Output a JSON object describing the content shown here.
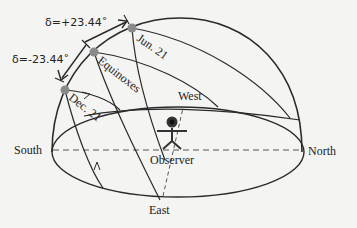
{
  "diagram": {
    "labels": {
      "delta_plus": "δ=+23.44˚",
      "delta_minus": "δ=-23.44˚",
      "jun": "Jun. 21",
      "equinoxes": "Equinoxes",
      "dec": "Dec. 21",
      "west": "West",
      "south": "South",
      "north": "North",
      "east": "East",
      "observer": "Observer"
    },
    "colors": {
      "line": "#2a2a2a",
      "sun_dot": "#8a8a8a",
      "background": "#f4f4f2"
    }
  }
}
